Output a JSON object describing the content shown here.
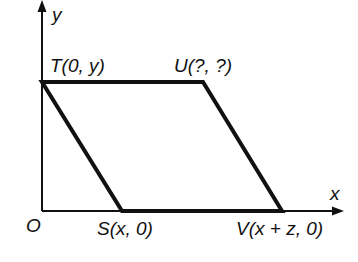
{
  "diagram": {
    "axes": {
      "x_label": "x",
      "y_label": "y",
      "origin_label": "O"
    },
    "points": {
      "T": {
        "label": "T(0, y)"
      },
      "U": {
        "label": "U(?, ?)"
      },
      "S": {
        "label": "S(x, 0)"
      },
      "V": {
        "label": "V(x + z, 0)"
      }
    },
    "shape": "parallelogram TUVS"
  }
}
